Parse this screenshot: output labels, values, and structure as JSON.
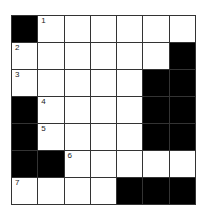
{
  "puzzle": {
    "rows": 7,
    "cols": 7,
    "colors": {
      "block": "#000000",
      "cell": "#ffffff",
      "line": "#333333"
    },
    "grid": [
      [
        "#",
        "1",
        "",
        "",
        "",
        "",
        ""
      ],
      [
        "2",
        "",
        "",
        "",
        "",
        "",
        "#"
      ],
      [
        "3",
        "",
        "",
        "",
        "",
        "#",
        "#"
      ],
      [
        "#",
        "4",
        "",
        "",
        "",
        "#",
        "#"
      ],
      [
        "#",
        "5",
        "",
        "",
        "",
        "#",
        "#"
      ],
      [
        "#",
        "#",
        "6",
        "",
        "",
        "",
        ""
      ],
      [
        "7",
        "",
        "",
        "",
        "#",
        "#",
        "#"
      ]
    ]
  }
}
